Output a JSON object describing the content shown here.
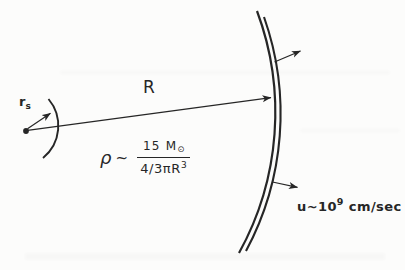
{
  "colors": {
    "ink": "#262626",
    "background": "#fcfcfb"
  },
  "labels": {
    "core_radius": {
      "base": "r",
      "sub": "s"
    },
    "shell_radius": "R",
    "density_formula": {
      "lhs": "ρ",
      "relation": "~",
      "numerator": {
        "text": "15 M",
        "sub": "⊙"
      },
      "denominator": {
        "text": "4/3πR",
        "sup": "3"
      }
    },
    "velocity": {
      "base": "u~10",
      "sup": "9",
      "unit": "cm/sec"
    }
  }
}
